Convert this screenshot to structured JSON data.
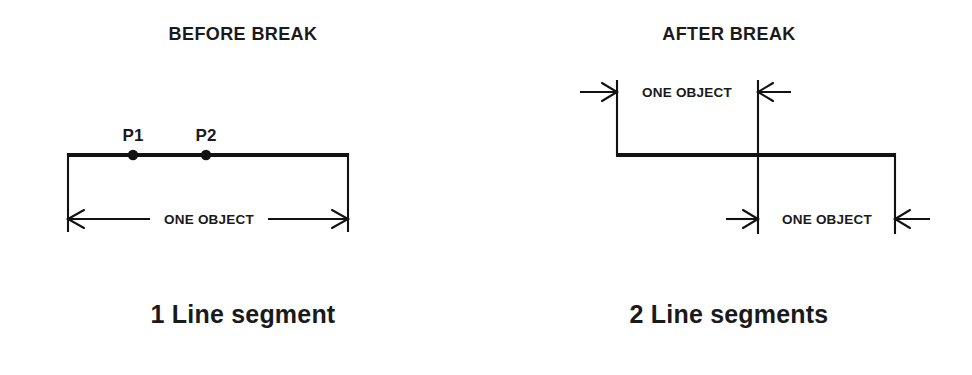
{
  "figure": {
    "width": 972,
    "height": 375,
    "background": "#ffffff",
    "ink_color": "#121212"
  },
  "panels": [
    {
      "id": "before",
      "title": "BEFORE BREAK",
      "caption": "1 Line segment",
      "dimension_labels": [
        "ONE OBJECT"
      ],
      "point_labels": [
        "P1",
        "P2"
      ],
      "segment_count": 1
    },
    {
      "id": "after",
      "title": "AFTER BREAK",
      "caption": "2 Line segments",
      "dimension_labels": [
        "ONE OBJECT",
        "ONE OBJECT"
      ],
      "point_labels": [],
      "segment_count": 2
    }
  ],
  "before": {
    "title": "BEFORE BREAK",
    "caption": "1 Line segment",
    "label_p1": "P1",
    "label_p2": "P2",
    "dimension_text": "ONE OBJECT"
  },
  "after": {
    "title": "AFTER BREAK",
    "caption": "2 Line segments",
    "dimension_text_upper": "ONE OBJECT",
    "dimension_text_lower": "ONE OBJECT"
  }
}
